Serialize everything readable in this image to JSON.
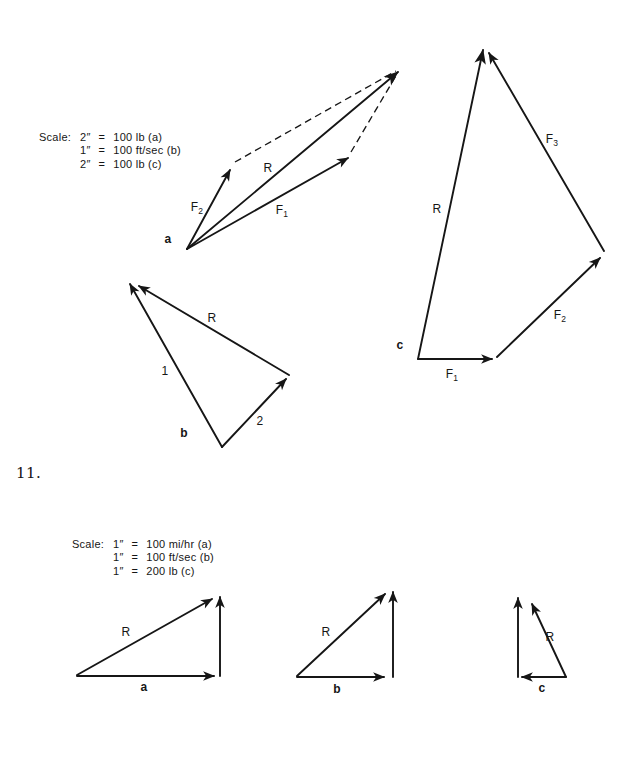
{
  "page": {
    "problem_number": "11."
  },
  "colors": {
    "ink": "#161616",
    "paper": "#ffffff"
  },
  "figure_top": {
    "scale": {
      "label": "Scale:",
      "rows": [
        {
          "lhs": "2″",
          "eq": "=",
          "rhs": "100 lb (a)"
        },
        {
          "lhs": "1″",
          "eq": "=",
          "rhs": "100 ft/sec (b)"
        },
        {
          "lhs": "2″",
          "eq": "=",
          "rhs": "100 lb (c)"
        }
      ]
    },
    "diagram_a": {
      "label": "a",
      "labels": {
        "f1": {
          "base": "F",
          "sub": "1"
        },
        "f2": {
          "base": "F",
          "sub": "2"
        },
        "r": "R"
      }
    },
    "diagram_b": {
      "label": "b",
      "labels": {
        "v1": "1",
        "v2": "2",
        "r": "R"
      }
    },
    "diagram_c": {
      "label": "c",
      "labels": {
        "f1": {
          "base": "F",
          "sub": "1"
        },
        "f2": {
          "base": "F",
          "sub": "2"
        },
        "f3": {
          "base": "F",
          "sub": "3"
        },
        "r": "R"
      }
    }
  },
  "figure_bottom": {
    "scale": {
      "label": "Scale:",
      "rows": [
        {
          "lhs": "1″",
          "eq": "=",
          "rhs": "100 mi/hr (a)"
        },
        {
          "lhs": "1″",
          "eq": "=",
          "rhs": "100 ft/sec (b)"
        },
        {
          "lhs": "1″",
          "eq": "=",
          "rhs": "200 lb (c)"
        }
      ]
    },
    "diagram_a": {
      "label": "a",
      "r_label": "R"
    },
    "diagram_b": {
      "label": "b",
      "r_label": "R"
    },
    "diagram_c": {
      "label": "c",
      "r_label": "R"
    }
  }
}
